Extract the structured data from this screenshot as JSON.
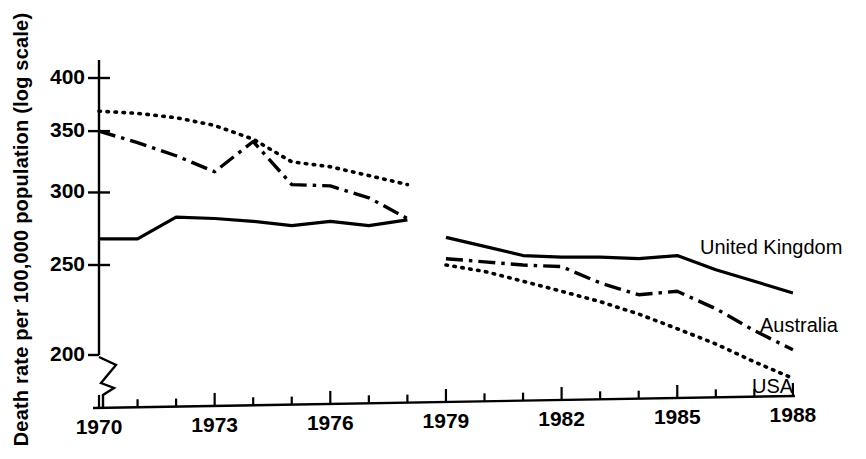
{
  "chart_data": {
    "type": "line",
    "title": "",
    "xlabel": "",
    "ylabel": "Death rate per 100,000 population (log scale)",
    "yscale": "log",
    "ylim": [
      195,
      420
    ],
    "xlim": [
      1969.2,
      1988.8
    ],
    "grid": false,
    "legend_position": "inline-right",
    "axis_break": "y-axis broken below 200",
    "y_ticks": [
      400,
      350,
      300,
      250,
      200
    ],
    "y_tick_labels": [
      "400",
      "350",
      "300",
      "250",
      "200"
    ],
    "x_ticks": [
      1970,
      1971,
      1972,
      1973,
      1974,
      1975,
      1976,
      1977,
      1978,
      1979,
      1980,
      1981,
      1982,
      1983,
      1984,
      1985,
      1986,
      1987,
      1988
    ],
    "x_tick_labels": [
      "1970",
      "",
      "",
      "1973",
      "",
      "",
      "1976",
      "",
      "",
      "1979",
      "",
      "",
      "1982",
      "",
      "",
      "1985",
      "",
      "",
      "1988"
    ],
    "x_labeled_ticks": [
      {
        "year": 1970,
        "label": "1970"
      },
      {
        "year": 1973,
        "label": "1973"
      },
      {
        "year": 1976,
        "label": "1976"
      },
      {
        "year": 1979,
        "label": "1979"
      },
      {
        "year": 1982,
        "label": "1982"
      },
      {
        "year": 1985,
        "label": "1985"
      },
      {
        "year": 1988,
        "label": "1988"
      }
    ],
    "data_gap": {
      "from": 1978,
      "to": 1979,
      "note": "all series break between 1978 and 1979"
    },
    "series": [
      {
        "name": "USA",
        "style": "dotted",
        "color": "#000000",
        "segments": [
          {
            "x": [
              1970,
              1971,
              1972,
              1973,
              1974,
              1975,
              1976,
              1977,
              1978
            ],
            "values": [
              368,
              366,
              362,
              355,
              343,
              324,
              320,
              313,
              306
            ]
          },
          {
            "x": [
              1979,
              1980,
              1981,
              1982,
              1983,
              1984,
              1985,
              1986,
              1987,
              1988
            ],
            "values": [
              250,
              246,
              240,
              234,
              228,
              221,
              213,
              205,
              196,
              188
            ]
          }
        ]
      },
      {
        "name": "Australia",
        "style": "dash-dot",
        "color": "#000000",
        "segments": [
          {
            "x": [
              1970,
              1971,
              1972,
              1973,
              1974,
              1975,
              1976,
              1977,
              1978
            ],
            "values": [
              350,
              340,
              329,
              316,
              341,
              306,
              305,
              296,
              281
            ]
          },
          {
            "x": [
              1979,
              1980,
              1981,
              1982,
              1983,
              1984,
              1985,
              1986,
              1987,
              1988
            ],
            "values": [
              254,
              252,
              250,
              249,
              239,
              232,
              234,
              224,
              212,
              202
            ]
          }
        ]
      },
      {
        "name": "United Kingdom",
        "style": "solid",
        "color": "#000000",
        "segments": [
          {
            "x": [
              1970,
              1971,
              1972,
              1973,
              1974,
              1975,
              1976,
              1977,
              1978
            ],
            "values": [
              267,
              267,
              282,
              281,
              279,
              276,
              279,
              276,
              280
            ]
          },
          {
            "x": [
              1979,
              1980,
              1981,
              1982,
              1983,
              1984,
              1985,
              1986,
              1987,
              1988
            ],
            "values": [
              268,
              262,
              256,
              255,
              255,
              254,
              256,
              247,
              240,
              233
            ]
          }
        ]
      }
    ],
    "series_labels": [
      {
        "name": "United Kingdom",
        "text": "United Kingdom"
      },
      {
        "name": "Australia",
        "text": "Australia"
      },
      {
        "name": "USA",
        "text": "USA"
      }
    ]
  }
}
